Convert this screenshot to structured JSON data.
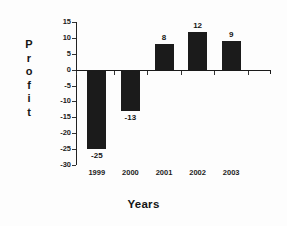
{
  "chart_data": {
    "type": "bar",
    "title": "",
    "categories": [
      "1999",
      "2000",
      "2001",
      "2002",
      "2003"
    ],
    "values": [
      -25,
      -13,
      8,
      12,
      9
    ],
    "data_labels": [
      "-25",
      "-13",
      "8",
      "12",
      "9"
    ],
    "series": [
      {
        "name": "Profit",
        "values": [
          -25,
          -13,
          8,
          12,
          9
        ]
      }
    ],
    "xlabel": "Years",
    "ylabel": "Profit",
    "ylim": [
      -30,
      15
    ],
    "ytick_values": [
      15,
      10,
      5,
      0,
      -5,
      -10,
      -15,
      -20,
      -25,
      -30
    ],
    "ytick_labels": [
      "15",
      "10",
      "5",
      "0",
      "-5",
      "-10",
      "-15",
      "-20",
      "-25",
      "-30"
    ],
    "grid": false,
    "legend": false,
    "legend_position": "none",
    "bar_color": "#1b1b1b",
    "axis_color": "#1a1a1a",
    "background_color": "#fdfdfd"
  },
  "axis": {
    "y_title_letters": [
      "P",
      "r",
      "o",
      "f",
      "i",
      "t"
    ]
  }
}
